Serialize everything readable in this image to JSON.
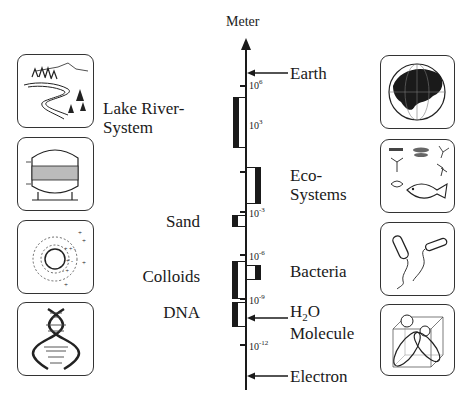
{
  "axis": {
    "title": "Meter",
    "ticks": [
      {
        "base": "10",
        "exp": "6",
        "y": 85
      },
      {
        "base": "10",
        "exp": "3",
        "y": 123
      },
      {
        "base": "10",
        "exp": "-3",
        "y": 211
      },
      {
        "base": "10",
        "exp": "-6",
        "y": 254
      },
      {
        "base": "10",
        "exp": "-9",
        "y": 298
      },
      {
        "base": "10",
        "exp": "-12",
        "y": 344
      }
    ]
  },
  "left_labels": {
    "lake_river_line1": "Lake River-",
    "lake_river_line2": "System",
    "sand": "Sand",
    "colloids": "Colloids",
    "dna": "DNA"
  },
  "right_labels": {
    "earth": "Earth",
    "eco_line1": "Eco-",
    "eco_line2": "Systems",
    "bacteria": "Bacteria",
    "h2o_h": "H",
    "h2o_sub": "2",
    "h2o_o": "O",
    "molecule": "Molecule",
    "electron": "Electron"
  },
  "icons": {
    "left": [
      "landscape-river",
      "filter-tank",
      "colloid-particle",
      "dna-helix"
    ],
    "right": [
      "globe",
      "ecosystem-organisms",
      "bacteria",
      "water-molecule"
    ]
  },
  "colors": {
    "ink": "#1a1a1a",
    "background": "#ffffff"
  }
}
